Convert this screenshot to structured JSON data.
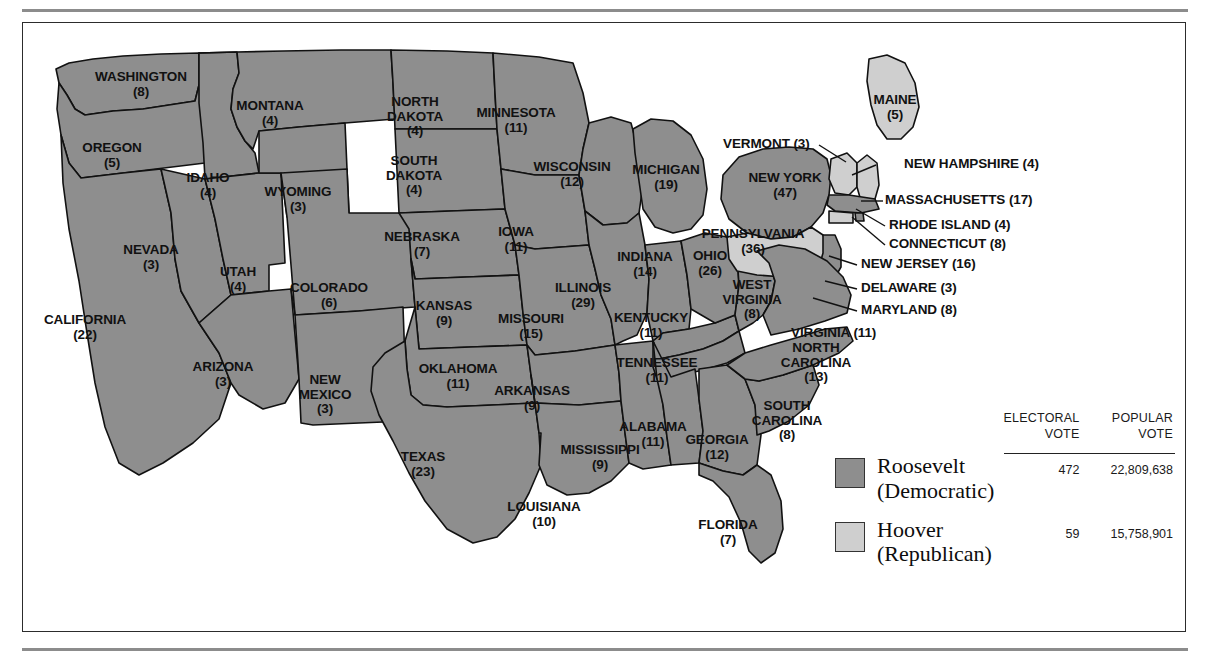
{
  "legend": {
    "columns": {
      "electoral": "ELECTORAL\nVOTE",
      "electoral_line1": "ELECTORAL",
      "electoral_line2": "VOTE",
      "popular_line1": "POPULAR",
      "popular_line2": "VOTE"
    },
    "entries": [
      {
        "candidate": "Roosevelt",
        "party": "(Democratic)",
        "electoral_vote": "472",
        "popular_vote": "22,809,638",
        "color": "#8e8e8e"
      },
      {
        "candidate": "Hoover",
        "party": "(Republican)",
        "electoral_vote": "59",
        "popular_vote": "15,758,901",
        "color": "#cfcfcf"
      }
    ]
  },
  "colors": {
    "roosevelt": "#8e8e8e",
    "hoover": "#cfcfcf",
    "border": "#111111",
    "water": "#ffffff",
    "rule": "#8c8c8c"
  },
  "states": [
    {
      "name": "WASHINGTON",
      "votes": "(8)",
      "winner": "roosevelt",
      "x": 118,
      "y": 62,
      "layout": "stack"
    },
    {
      "name": "OREGON",
      "votes": "(5)",
      "winner": "roosevelt",
      "x": 89,
      "y": 133,
      "layout": "stack"
    },
    {
      "name": "CALIFORNIA",
      "votes": "(22)",
      "winner": "roosevelt",
      "x": 62,
      "y": 305,
      "layout": "stack"
    },
    {
      "name": "IDAHO",
      "votes": "(4)",
      "winner": "roosevelt",
      "x": 185,
      "y": 163,
      "layout": "stack"
    },
    {
      "name": "NEVADA",
      "votes": "(3)",
      "winner": "roosevelt",
      "x": 128,
      "y": 235,
      "layout": "stack"
    },
    {
      "name": "UTAH",
      "votes": "(4)",
      "winner": "roosevelt",
      "x": 215,
      "y": 257,
      "layout": "stack"
    },
    {
      "name": "ARIZONA",
      "votes": "(3)",
      "winner": "roosevelt",
      "x": 200,
      "y": 352,
      "layout": "stack"
    },
    {
      "name": "MONTANA",
      "votes": "(4)",
      "winner": "roosevelt",
      "x": 247,
      "y": 91,
      "layout": "stack"
    },
    {
      "name": "WYOMING",
      "votes": "(3)",
      "winner": "roosevelt",
      "x": 275,
      "y": 177,
      "layout": "stack"
    },
    {
      "name": "COLORADO",
      "votes": "(6)",
      "winner": "roosevelt",
      "x": 306,
      "y": 273,
      "layout": "stack"
    },
    {
      "name": "NEW\nMEXICO",
      "votes": "(3)",
      "winner": "roosevelt",
      "x": 302,
      "y": 372,
      "layout": "stack2",
      "line1": "NEW",
      "line2": "MEXICO"
    },
    {
      "name": "NORTH\nDAKOTA",
      "votes": "(4)",
      "winner": "roosevelt",
      "x": 392,
      "y": 94,
      "layout": "stack2",
      "line1": "NORTH",
      "line2": "DAKOTA"
    },
    {
      "name": "SOUTH\nDAKOTA",
      "votes": "(4)",
      "winner": "roosevelt",
      "x": 391,
      "y": 153,
      "layout": "stack2",
      "line1": "SOUTH",
      "line2": "DAKOTA"
    },
    {
      "name": "NEBRASKA",
      "votes": "(7)",
      "winner": "roosevelt",
      "x": 399,
      "y": 222,
      "layout": "stack"
    },
    {
      "name": "KANSAS",
      "votes": "(9)",
      "winner": "roosevelt",
      "x": 421,
      "y": 291,
      "layout": "stack"
    },
    {
      "name": "OKLAHOMA",
      "votes": "(11)",
      "winner": "roosevelt",
      "x": 435,
      "y": 354,
      "layout": "stack"
    },
    {
      "name": "TEXAS",
      "votes": "(23)",
      "winner": "roosevelt",
      "x": 400,
      "y": 442,
      "layout": "stack"
    },
    {
      "name": "MINNESOTA",
      "votes": "(11)",
      "winner": "roosevelt",
      "x": 493,
      "y": 98,
      "layout": "stack"
    },
    {
      "name": "IOWA",
      "votes": "(11)",
      "winner": "roosevelt",
      "x": 493,
      "y": 217,
      "layout": "stack"
    },
    {
      "name": "MISSOURI",
      "votes": "(15)",
      "winner": "roosevelt",
      "x": 508,
      "y": 304,
      "layout": "stack"
    },
    {
      "name": "ARKANSAS",
      "votes": "(9)",
      "winner": "roosevelt",
      "x": 509,
      "y": 376,
      "layout": "stack"
    },
    {
      "name": "LOUISIANA",
      "votes": "(10)",
      "winner": "roosevelt",
      "x": 521,
      "y": 492,
      "layout": "stack"
    },
    {
      "name": "WISCONSIN",
      "votes": "(12)",
      "winner": "roosevelt",
      "x": 549,
      "y": 152,
      "layout": "stack"
    },
    {
      "name": "ILLINOIS",
      "votes": "(29)",
      "winner": "roosevelt",
      "x": 560,
      "y": 273,
      "layout": "stack"
    },
    {
      "name": "MISSISSIPPI",
      "votes": "(9)",
      "winner": "roosevelt",
      "x": 577,
      "y": 435,
      "layout": "stack"
    },
    {
      "name": "MICHIGAN",
      "votes": "(19)",
      "winner": "roosevelt",
      "x": 643,
      "y": 155,
      "layout": "stack"
    },
    {
      "name": "INDIANA",
      "votes": "(14)",
      "winner": "roosevelt",
      "x": 622,
      "y": 242,
      "layout": "stack"
    },
    {
      "name": "KENTUCKY",
      "votes": "(11)",
      "winner": "roosevelt",
      "x": 628,
      "y": 303,
      "layout": "stack"
    },
    {
      "name": "TENNESSEE",
      "votes": "(11)",
      "winner": "roosevelt",
      "x": 634,
      "y": 348,
      "layout": "stack"
    },
    {
      "name": "ALABAMA",
      "votes": "(11)",
      "winner": "roosevelt",
      "x": 630,
      "y": 412,
      "layout": "stack"
    },
    {
      "name": "OHIO",
      "votes": "(26)",
      "winner": "roosevelt",
      "x": 687,
      "y": 241,
      "layout": "stack"
    },
    {
      "name": "GEORGIA",
      "votes": "(12)",
      "winner": "roosevelt",
      "x": 694,
      "y": 425,
      "layout": "stack"
    },
    {
      "name": "FLORIDA",
      "votes": "(7)",
      "winner": "roosevelt",
      "x": 705,
      "y": 510,
      "layout": "stack"
    },
    {
      "name": "WEST\nVIRGINIA",
      "votes": "(8)",
      "winner": "roosevelt",
      "x": 729,
      "y": 277,
      "layout": "stack2",
      "line1": "WEST",
      "line2": "VIRGINIA"
    },
    {
      "name": "SOUTH\nCAROLINA",
      "votes": "(8)",
      "winner": "roosevelt",
      "x": 764,
      "y": 398,
      "layout": "stack2",
      "line1": "SOUTH",
      "line2": "CAROLINA"
    },
    {
      "name": "NORTH\nCAROLINA",
      "votes": "(13)",
      "winner": "roosevelt",
      "x": 793,
      "y": 340,
      "layout": "stack2",
      "line1": "NORTH",
      "line2": "CAROLINA"
    },
    {
      "name": "NEW YORK",
      "votes": "(47)",
      "winner": "roosevelt",
      "x": 762,
      "y": 163,
      "layout": "stack"
    },
    {
      "name": "PENNSYLVANIA",
      "votes": "(36)",
      "winner": "hoover",
      "x": 730,
      "y": 219,
      "layout": "stack"
    },
    {
      "name": "MAINE",
      "votes": "(5)",
      "winner": "hoover",
      "x": 872,
      "y": 85,
      "layout": "stack"
    }
  ],
  "callouts": [
    {
      "name": "VERMONT",
      "votes": "(3)",
      "winner": "hoover",
      "label_x": 700,
      "label_y": 121,
      "lx1": 796,
      "ly1": 122,
      "lx2": 823,
      "ly2": 139
    },
    {
      "name": "NEW HAMPSHIRE",
      "votes": "(4)",
      "winner": "hoover",
      "label_x": 881,
      "label_y": 141,
      "lx1": 853,
      "ly1": 142,
      "lx2": 829,
      "ly2": 152
    },
    {
      "name": "MASSACHUSETTS",
      "votes": "(17)",
      "winner": "roosevelt",
      "label_x": 862,
      "label_y": 177,
      "lx1": 860,
      "ly1": 178,
      "lx2": 838,
      "ly2": 178
    },
    {
      "name": "RHODE ISLAND",
      "votes": "(4)",
      "winner": "roosevelt",
      "label_x": 866,
      "label_y": 202,
      "lx1": 862,
      "ly1": 203,
      "lx2": 833,
      "ly2": 186
    },
    {
      "name": "CONNECTICUT",
      "votes": "(8)",
      "winner": "hoover",
      "label_x": 866,
      "label_y": 221,
      "lx1": 862,
      "ly1": 222,
      "lx2": 829,
      "ly2": 194
    },
    {
      "name": "NEW JERSEY",
      "votes": "(16)",
      "winner": "roosevelt",
      "label_x": 838,
      "label_y": 241,
      "lx1": 834,
      "ly1": 242,
      "lx2": 806,
      "ly2": 233
    },
    {
      "name": "DELAWARE",
      "votes": "(3)",
      "winner": "hoover",
      "label_x": 838,
      "label_y": 265,
      "lx1": 834,
      "ly1": 266,
      "lx2": 802,
      "ly2": 258
    },
    {
      "name": "MARYLAND",
      "votes": "(8)",
      "winner": "roosevelt",
      "label_x": 838,
      "label_y": 287,
      "lx1": 834,
      "ly1": 288,
      "lx2": 790,
      "ly2": 275
    },
    {
      "name": "VIRGINIA",
      "votes": "(11)",
      "winner": "roosevelt",
      "label_x": 768,
      "label_y": 310,
      "lx1": 0,
      "ly1": 0,
      "lx2": 0,
      "ly2": 0
    }
  ]
}
